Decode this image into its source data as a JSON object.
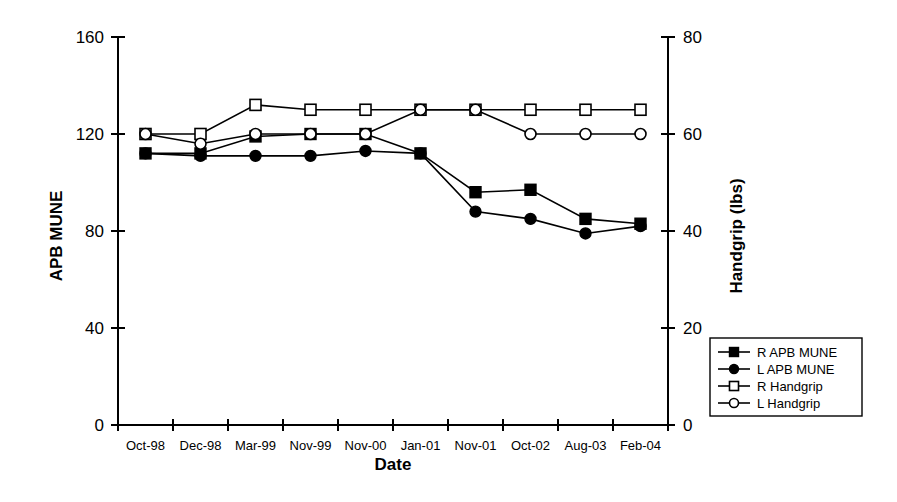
{
  "chart_data": {
    "type": "line",
    "title": "",
    "xlabel": "Date",
    "ylabel": "APB MUNE",
    "y2label": "Handgrip (lbs)",
    "categories": [
      "Oct-98",
      "Dec-98",
      "Mar-99",
      "Nov-99",
      "Nov-00",
      "Jan-01",
      "Nov-01",
      "Oct-02",
      "Aug-03",
      "Feb-04"
    ],
    "ylim": [
      0,
      160
    ],
    "yticks": [
      0,
      40,
      80,
      120,
      160
    ],
    "y2lim": [
      0,
      80
    ],
    "y2ticks": [
      0,
      20,
      40,
      60,
      80
    ],
    "grid": false,
    "legend_position": "bottom-right",
    "series": [
      {
        "name": "R APB  MUNE",
        "axis": "left",
        "marker": "filled-square",
        "values": [
          112,
          112,
          119,
          120,
          120,
          112,
          96,
          97,
          85,
          83
        ]
      },
      {
        "name": "L  APB MUNE",
        "axis": "left",
        "marker": "filled-circle",
        "values": [
          112,
          111,
          111,
          111,
          113,
          112,
          88,
          85,
          79,
          82
        ]
      },
      {
        "name": "R Handgrip",
        "axis": "right",
        "marker": "open-square",
        "values": [
          60,
          60,
          66,
          65,
          65,
          65,
          65,
          65,
          65,
          65
        ]
      },
      {
        "name": "L Handgrip",
        "axis": "right",
        "marker": "open-circle",
        "values": [
          60,
          58,
          60,
          60,
          60,
          65,
          65,
          60,
          60,
          60
        ]
      }
    ]
  },
  "colors": {
    "ink": "#000000",
    "paper": "#ffffff"
  }
}
